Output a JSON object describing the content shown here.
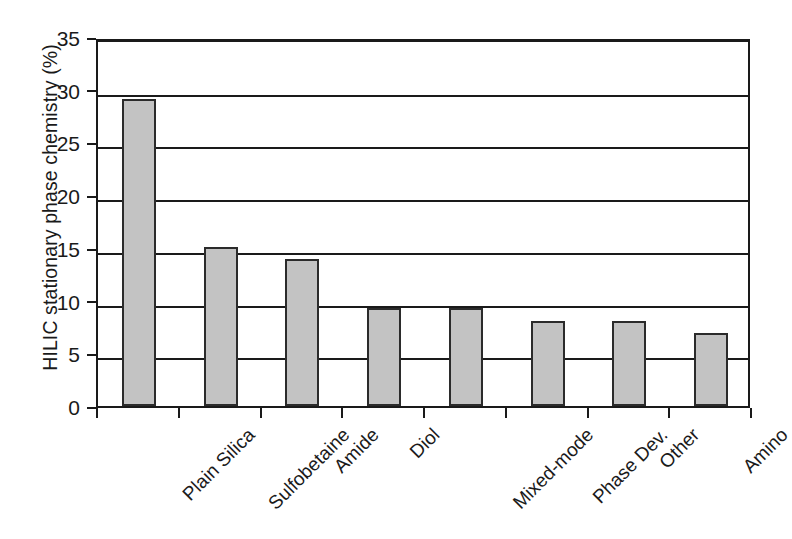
{
  "chart_data": {
    "type": "bar",
    "title": "",
    "subtitle": "",
    "xlabel": "",
    "ylabel": "HILIC stationary phase chemistry (%)",
    "ylim": [
      0,
      35
    ],
    "ytick_labels": [
      "0",
      "5",
      "10",
      "15",
      "20",
      "25",
      "30",
      "35"
    ],
    "ytick_values": [
      0,
      5,
      10,
      15,
      20,
      25,
      30,
      35
    ],
    "grid": "horizontal",
    "legend": "none",
    "bar_fill_color": "#c3c3c3",
    "bar_edge_color": "#2b2b2b",
    "axis_color": "#1a1a1a",
    "background_color": "#ffffff",
    "categories": [
      "Plain Silica",
      "Sulfobetaine",
      "Amide",
      "Diol",
      "Mixed-mode",
      "Phase Dev.",
      "Other",
      "Amino"
    ],
    "values": [
      29.1,
      15.1,
      13.9,
      9.3,
      9.3,
      8.1,
      8.1,
      6.9
    ],
    "series": [
      {
        "name": "HILIC stationary phase chemistry",
        "values": [
          29.1,
          15.1,
          13.9,
          9.3,
          9.3,
          8.1,
          8.1,
          6.9
        ]
      }
    ]
  }
}
